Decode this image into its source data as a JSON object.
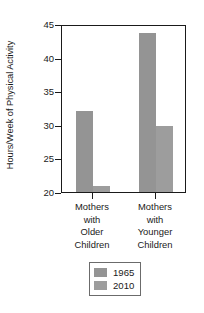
{
  "chart_data": {
    "type": "bar",
    "title": "",
    "subtitle": "",
    "xlabel": "",
    "ylabel": "Hours/Week of Physical Activity",
    "categories": [
      "Mothers\nwith\nOlder\nChildren",
      "Mothers\nwith\nYounger\nChildren"
    ],
    "series": [
      {
        "name": "1965",
        "values": [
          32.0,
          43.6
        ],
        "color": "#949494"
      },
      {
        "name": "2010",
        "values": [
          20.9,
          29.8
        ],
        "color": "#9d9d9d"
      }
    ],
    "ylim": [
      20,
      45
    ],
    "yticks": [
      20,
      25,
      30,
      35,
      40,
      45
    ],
    "ytick_labels": [
      "20",
      "25",
      "30",
      "35",
      "40",
      "45"
    ],
    "grid": false,
    "legend_position": "bottom-center"
  },
  "axis": {
    "y_title": "Hours/Week of Physical Activity",
    "y_ticks": [
      {
        "value": 45,
        "label": "45"
      },
      {
        "value": 40,
        "label": "40"
      },
      {
        "value": 35,
        "label": "35"
      },
      {
        "value": 30,
        "label": "30"
      },
      {
        "value": 25,
        "label": "25"
      },
      {
        "value": 20,
        "label": "20"
      }
    ],
    "x_groups": [
      {
        "id": "older",
        "lines": [
          "Mothers",
          "with",
          "Older",
          "Children"
        ]
      },
      {
        "id": "younger",
        "lines": [
          "Mothers",
          "with",
          "Younger",
          "Children"
        ]
      }
    ]
  },
  "legend": {
    "entries": [
      {
        "label": "1965",
        "color": "#949494"
      },
      {
        "label": "2010",
        "color": "#9d9d9d"
      }
    ]
  },
  "style": {
    "axis_color": "#1a1a1a",
    "frame_color": "#1a1a1a",
    "legend_border": "#6b6b6b",
    "background": "#ffffff"
  }
}
